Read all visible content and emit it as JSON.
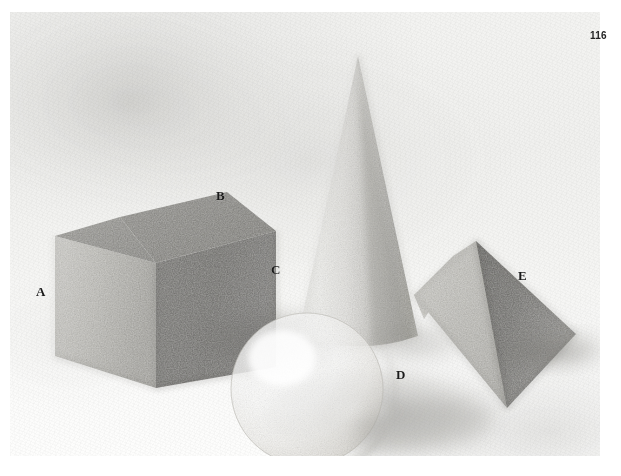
{
  "page": {
    "number": "116",
    "medium": "graphite pencil drawing on textured paper"
  },
  "plate": {
    "background_color": "#f2f2f0",
    "ink_color": "#1a1a1a"
  },
  "labels": [
    {
      "id": "A",
      "text": "A",
      "refers_to": "cube-left-face",
      "x": 42,
      "y": 292
    },
    {
      "id": "B",
      "text": "B",
      "refers_to": "cube-top-face",
      "x": 222,
      "y": 196
    },
    {
      "id": "C",
      "text": "C",
      "refers_to": "cone-surface",
      "x": 277,
      "y": 270
    },
    {
      "id": "D",
      "text": "D",
      "refers_to": "pyramid-left-face",
      "x": 402,
      "y": 375
    },
    {
      "id": "E",
      "text": "E",
      "refers_to": "pyramid-right-face",
      "x": 524,
      "y": 276
    }
  ],
  "objects": [
    {
      "name": "cube",
      "label_faces": [
        "A",
        "B"
      ],
      "description": "cube in three-quarter view, light left face, mid-dark top face, dark right face"
    },
    {
      "name": "cone",
      "label_faces": [
        "C"
      ],
      "description": "tall cone, light on left, gradated dark shading down the right side"
    },
    {
      "name": "sphere",
      "label_faces": [],
      "description": "sphere with bright highlight upper-left and soft core shadow lower-right"
    },
    {
      "name": "pyramid",
      "label_faces": [
        "D",
        "E"
      ],
      "description": "square pyramid, mid-tone left face, darkest right face"
    }
  ]
}
